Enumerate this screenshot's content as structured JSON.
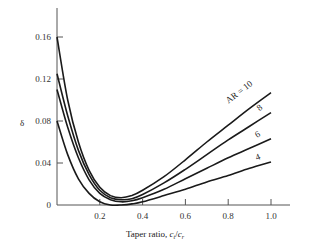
{
  "chart_data": {
    "type": "line",
    "title": "",
    "xlabel": "Taper ratio, c_t/c_r",
    "xlabel_parts": {
      "main": "Taper ratio, ",
      "ct": "c",
      "ct_sub": "t",
      "slash": "/",
      "cr": "c",
      "cr_sub": "r"
    },
    "ylabel": "δ",
    "xlim": [
      0,
      1.0
    ],
    "ylim": [
      0,
      0.18
    ],
    "x_ticks": [
      "0.2",
      "0.4",
      "0.6",
      "0.8",
      "1.0"
    ],
    "y_ticks": [
      "0",
      "0.04",
      "0.08",
      "0.12",
      "0.16"
    ],
    "grid": false,
    "legend": "inline labels at curve ends",
    "series": [
      {
        "name": "AR = 10",
        "label": "AR = 10",
        "x": [
          0.0,
          0.05,
          0.1,
          0.15,
          0.2,
          0.25,
          0.3,
          0.35,
          0.4,
          0.5,
          0.6,
          0.7,
          0.8,
          0.9,
          1.0
        ],
        "y": [
          0.16,
          0.1,
          0.06,
          0.033,
          0.017,
          0.009,
          0.007,
          0.009,
          0.014,
          0.027,
          0.043,
          0.06,
          0.076,
          0.092,
          0.107
        ]
      },
      {
        "name": "AR = 8",
        "label": "8",
        "x": [
          0.0,
          0.05,
          0.1,
          0.15,
          0.2,
          0.25,
          0.3,
          0.35,
          0.4,
          0.5,
          0.6,
          0.7,
          0.8,
          0.9,
          1.0
        ],
        "y": [
          0.125,
          0.085,
          0.052,
          0.029,
          0.014,
          0.007,
          0.005,
          0.006,
          0.01,
          0.021,
          0.034,
          0.048,
          0.062,
          0.075,
          0.088
        ]
      },
      {
        "name": "AR = 6",
        "label": "6",
        "x": [
          0.0,
          0.05,
          0.1,
          0.15,
          0.2,
          0.25,
          0.3,
          0.35,
          0.4,
          0.5,
          0.6,
          0.7,
          0.8,
          0.9,
          1.0
        ],
        "y": [
          0.11,
          0.074,
          0.045,
          0.024,
          0.011,
          0.005,
          0.003,
          0.004,
          0.007,
          0.015,
          0.025,
          0.035,
          0.045,
          0.054,
          0.063
        ]
      },
      {
        "name": "AR = 4",
        "label": "4",
        "x": [
          0.0,
          0.05,
          0.1,
          0.15,
          0.2,
          0.25,
          0.3,
          0.35,
          0.4,
          0.5,
          0.6,
          0.7,
          0.8,
          0.9,
          1.0
        ],
        "y": [
          0.08,
          0.048,
          0.025,
          0.011,
          0.003,
          0.0,
          0.0,
          0.001,
          0.003,
          0.009,
          0.015,
          0.022,
          0.028,
          0.035,
          0.041
        ]
      }
    ]
  },
  "style": {
    "line_color": "#1a1a1a",
    "axis_color": "#555555",
    "text_color": "#333333"
  }
}
